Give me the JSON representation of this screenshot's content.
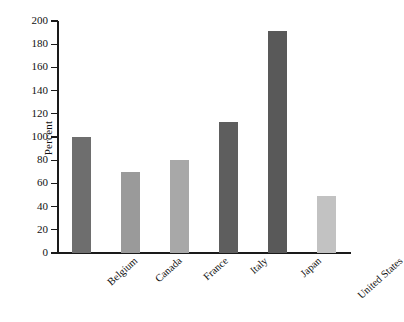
{
  "chart_data": {
    "type": "bar",
    "title": "",
    "subtitle": "",
    "xlabel": "",
    "ylabel": "Percent",
    "categories": [
      "Belgium",
      "Canada",
      "France",
      "Italy",
      "Japan",
      "United States"
    ],
    "values": [
      100,
      70,
      80,
      113,
      191,
      49
    ],
    "bar_colors": [
      "#6e6e6e",
      "#9a9a9a",
      "#a8a8a8",
      "#5e5e5e",
      "#595959",
      "#c2c2c2"
    ],
    "ylim": [
      0,
      200
    ],
    "ytick_values": [
      0,
      20,
      40,
      60,
      80,
      100,
      120,
      140,
      160,
      180,
      200
    ],
    "ytick_labels": [
      "0",
      "20",
      "40",
      "60",
      "80",
      "100",
      "120",
      "140",
      "160",
      "180",
      "200"
    ],
    "grid": false,
    "legend": false,
    "legend_position": "none",
    "xtick_rotation": -42,
    "background_color": "#ffffff",
    "axis_color": "#1a1a1a",
    "text_color": "#111111"
  }
}
